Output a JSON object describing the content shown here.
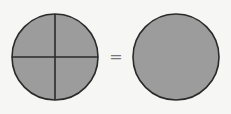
{
  "diagram": {
    "colors": {
      "background": "#f6f6f4",
      "fill": "#9c9c9c",
      "stroke": "#2a2a2a"
    },
    "left_circle": {
      "label": "circle divided into 4 equal parts",
      "parts": 4,
      "shaded_parts": 4,
      "cx": 55,
      "cy": 57,
      "r": 43
    },
    "operator": "=",
    "right_circle": {
      "label": "whole circle",
      "parts": 1,
      "shaded_parts": 1,
      "cx": 176,
      "cy": 57,
      "r": 43
    }
  }
}
